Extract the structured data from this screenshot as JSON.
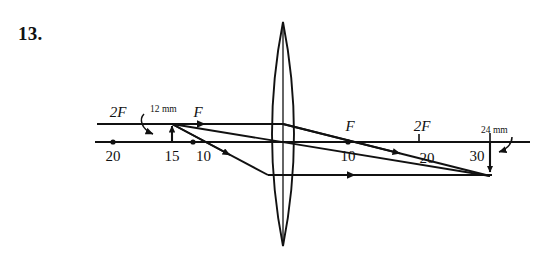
{
  "problem": {
    "number": "13."
  },
  "diagram": {
    "type": "thin-lens-ray-diagram",
    "lens": {
      "kind": "converging-biconvex",
      "center_x": 283,
      "top_y": 22,
      "bottom_y": 246,
      "half_width": 22
    },
    "axis": {
      "y": 142,
      "x_start": 95,
      "x_end": 530
    },
    "ink_color": "#111111",
    "background_color": "#ffffff",
    "object": {
      "label": "12 mm",
      "size_mm": 12,
      "position_label": "15",
      "orientation": "upright",
      "x": 172,
      "tip_y": 123
    },
    "image": {
      "label": "24 mm",
      "size_mm": 24,
      "position_label": "30",
      "orientation": "inverted",
      "x": 490,
      "tip_y": 176
    },
    "left_labels": [
      {
        "text": "2F",
        "x": 118,
        "y": 117,
        "kind": "focal"
      },
      {
        "text": "F",
        "x": 196,
        "y": 117,
        "kind": "focal"
      },
      {
        "text": "20",
        "x": 113,
        "y": 159,
        "kind": "scale"
      },
      {
        "text": "15",
        "x": 172,
        "y": 159,
        "kind": "scale"
      },
      {
        "text": "10",
        "x": 193,
        "y": 159,
        "kind": "scale"
      }
    ],
    "right_labels": [
      {
        "text": "F",
        "x": 348,
        "y": 130,
        "kind": "focal"
      },
      {
        "text": "2F",
        "x": 424,
        "y": 130,
        "kind": "focal"
      },
      {
        "text": "10",
        "x": 348,
        "y": 159,
        "kind": "scale"
      },
      {
        "text": "20",
        "x": 427,
        "y": 163,
        "kind": "scale"
      },
      {
        "text": "30",
        "x": 474,
        "y": 159,
        "kind": "scale"
      }
    ],
    "callouts": [
      {
        "text": "12 mm",
        "x": 146,
        "y": 113
      },
      {
        "text": "24 mm",
        "x": 478,
        "y": 133
      }
    ],
    "dots": [
      {
        "x": 113,
        "y": 142,
        "name": "two-f-left-point"
      },
      {
        "x": 193,
        "y": 142,
        "name": "f-left-point"
      },
      {
        "x": 348,
        "y": 142,
        "name": "f-right-point"
      }
    ],
    "rays": [
      {
        "name": "parallel-incident-ray",
        "from_x": 97,
        "from_y": 124,
        "to_x": 283,
        "to_y": 124
      },
      {
        "name": "refracted-through-f-ray",
        "from_x": 283,
        "from_y": 124,
        "to_x": 490,
        "to_y": 176
      },
      {
        "name": "through-center-ray",
        "from_x": 172,
        "from_y": 124,
        "to_x": 490,
        "to_y": 176
      },
      {
        "name": "through-f-incident-ray",
        "from_x": 172,
        "from_y": 124,
        "to_x": 268,
        "to_y": 175
      },
      {
        "name": "refracted-parallel-ray",
        "from_x": 268,
        "from_y": 175,
        "to_x": 490,
        "to_y": 175
      }
    ]
  }
}
